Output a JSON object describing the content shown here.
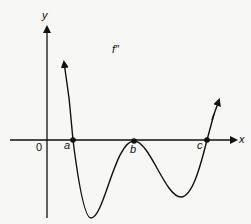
{
  "graph": {
    "function_label": "f″",
    "x_axis_label": "x",
    "y_axis_label": "y",
    "origin_label": "0",
    "points": [
      {
        "label": "a"
      },
      {
        "label": "b"
      },
      {
        "label": "c"
      }
    ],
    "colors": {
      "line": "#111111",
      "background": "#f7f7f5"
    }
  }
}
